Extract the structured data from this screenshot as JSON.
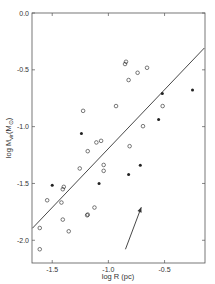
{
  "chart_data": {
    "type": "scatter",
    "title": "",
    "xlabel": "log R (pc)",
    "ylabel": "log M_vir (M_⊙)",
    "ylabel_parts": {
      "main": "log M",
      "sub": "vir",
      "unit": "(M",
      "unit_sub": "⊙",
      "close": ")"
    },
    "xlim": [
      -1.68,
      -0.14
    ],
    "ylim": [
      -2.2,
      0.0
    ],
    "grid": false,
    "legend": null,
    "x_ticks": [
      {
        "value": -1.5,
        "label": "-1.5"
      },
      {
        "value": -1.0,
        "label": "-1.0"
      },
      {
        "value": -0.5,
        "label": "-0.5"
      }
    ],
    "y_ticks": [
      {
        "value": 0.0,
        "label": "0.0"
      },
      {
        "value": -0.5,
        "label": "-0.5"
      },
      {
        "value": -1.0,
        "label": "-1.0"
      },
      {
        "value": -1.5,
        "label": "-1.5"
      },
      {
        "value": -2.0,
        "label": "-2.0"
      }
    ],
    "series": [
      {
        "name": "open circles",
        "marker": "open-circle",
        "points": [
          [
            -1.545,
            -1.648
          ],
          [
            -1.418,
            -1.668
          ],
          [
            -1.397,
            -1.53
          ],
          [
            -1.406,
            -1.551
          ],
          [
            -1.611,
            -1.892
          ],
          [
            -1.406,
            -1.818
          ],
          [
            -1.353,
            -1.921
          ],
          [
            -1.184,
            -1.774
          ],
          [
            -1.611,
            -2.079
          ],
          [
            -1.107,
            -1.139
          ],
          [
            -1.065,
            -1.125
          ],
          [
            -1.184,
            -1.216
          ],
          [
            -1.255,
            -1.368
          ],
          [
            -1.042,
            -1.337
          ],
          [
            -1.042,
            -1.389
          ],
          [
            -1.124,
            -1.712
          ],
          [
            -1.189,
            -1.78
          ],
          [
            -0.811,
            -1.172
          ],
          [
            -0.843,
            -0.429
          ],
          [
            -0.852,
            -0.449
          ],
          [
            -0.656,
            -0.482
          ],
          [
            -0.74,
            -0.526
          ],
          [
            -0.82,
            -0.59
          ],
          [
            -0.517,
            -0.819
          ],
          [
            -0.692,
            -0.996
          ],
          [
            -1.225,
            -0.861
          ],
          [
            -0.932,
            -0.819
          ]
        ]
      },
      {
        "name": "filled circles",
        "marker": "filled-circle",
        "points": [
          [
            -1.5,
            -1.515
          ],
          [
            -1.24,
            -1.06
          ],
          [
            -1.083,
            -1.5
          ],
          [
            -0.82,
            -1.421
          ],
          [
            -0.52,
            -0.709
          ],
          [
            -0.251,
            -0.678
          ],
          [
            -0.553,
            -0.937
          ],
          [
            -0.716,
            -1.339
          ]
        ]
      }
    ],
    "fit_line": {
      "x": [
        -1.676,
        -0.146
      ],
      "y": [
        -1.894,
        -0.308
      ]
    },
    "annotations": [
      {
        "type": "arrow",
        "from": [
          -0.848,
          -2.079
        ],
        "to": [
          -0.707,
          -1.709
        ]
      }
    ],
    "colors": {
      "axis": "#555555",
      "marker": "#222222",
      "line": "#333333",
      "text": "#333333"
    }
  }
}
